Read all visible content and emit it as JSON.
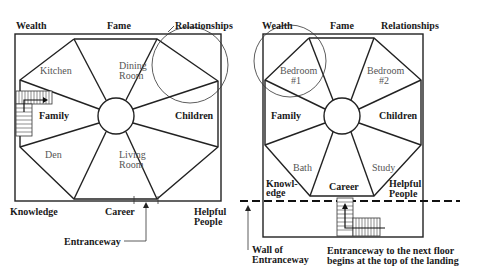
{
  "left_plan": {
    "areas": {
      "wealth": "Wealth",
      "fame": "Fame",
      "relationships": "Relationships",
      "family": "Family",
      "children": "Children",
      "knowledge": "Knowledge",
      "career": "Career",
      "helpful_1": "Helpful",
      "helpful_2": "People"
    },
    "rooms": {
      "kitchen": "Kitchen",
      "dining_1": "Dining",
      "dining_2": "Room",
      "den": "Den",
      "living_1": "Living",
      "living_2": "Room"
    },
    "entrance_label": "Entranceway"
  },
  "right_plan": {
    "areas": {
      "wealth": "Wealth",
      "fame": "Fame",
      "relationships": "Relationships",
      "family": "Family",
      "children": "Children",
      "knowledge_1": "Knowl-",
      "knowledge_2": "edge",
      "career": "Career",
      "helpful_1": "Helpful",
      "helpful_2": "People"
    },
    "rooms": {
      "bedroom1_1": "Bedroom",
      "bedroom1_2": "#1",
      "bedroom2_1": "Bedroom",
      "bedroom2_2": "#2",
      "bath": "Bath",
      "study": "Study"
    },
    "wall_label_1": "Wall of",
    "wall_label_2": "Entranceway",
    "note_1": "Entranceway to the next floor",
    "note_2": "begins at the top of the landing"
  }
}
